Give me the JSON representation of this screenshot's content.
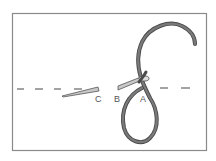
{
  "diagram": {
    "type": "embroidery-stitch-illustration",
    "labels": {
      "a": "A",
      "b": "B",
      "c": "C"
    },
    "colors": {
      "background": "#ffffff",
      "frame": "#8a8a8a",
      "thread": "#6e6e6e",
      "thread_outline": "#4a4a4a",
      "needle": "#c8c8c8",
      "needle_outline": "#555555",
      "stitch_line": "#666666"
    }
  }
}
